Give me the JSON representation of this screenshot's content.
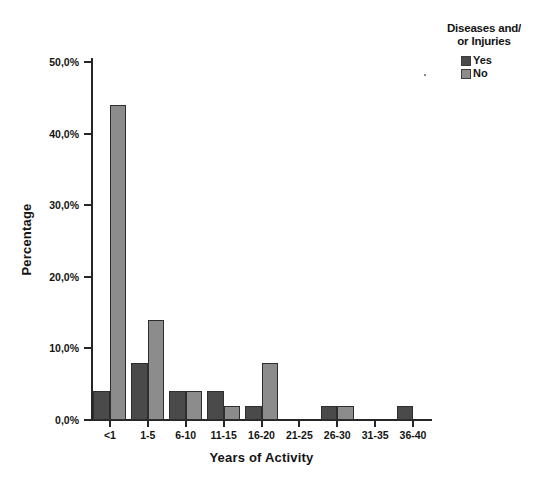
{
  "chart_data": {
    "type": "bar",
    "title": "",
    "xlabel": "Years of Activity",
    "ylabel": "Percentage",
    "categories": [
      "<1",
      "1-5",
      "6-10",
      "11-15",
      "16-20",
      "21-25",
      "26-30",
      "31-35",
      "36-40"
    ],
    "series": [
      {
        "name": "Yes",
        "color": "#4a4a4a",
        "values": [
          4,
          8,
          4,
          4,
          2,
          0,
          2,
          0,
          2
        ]
      },
      {
        "name": "No",
        "color": "#8c8c8c",
        "values": [
          44,
          14,
          4,
          2,
          8,
          0,
          2,
          0,
          0
        ]
      }
    ],
    "ylim": [
      0,
      54
    ],
    "yticks": [
      0,
      10,
      20,
      30,
      40,
      50
    ],
    "ytick_labels": [
      "0,0%",
      "10,0%",
      "20,0%",
      "30,0%",
      "40,0%",
      "50,0%"
    ],
    "grid": false,
    "legend": {
      "title_line_1": "Diseases and/",
      "title_line_2": "or Injuries",
      "position": "top-right",
      "entries": [
        {
          "label": "Yes",
          "color": "#4a4a4a"
        },
        {
          "label": "No",
          "color": "#8c8c8c"
        }
      ]
    },
    "value_unit": "%",
    "bar_edge_color": "#2e2e2e",
    "axis_color": "#262626"
  }
}
